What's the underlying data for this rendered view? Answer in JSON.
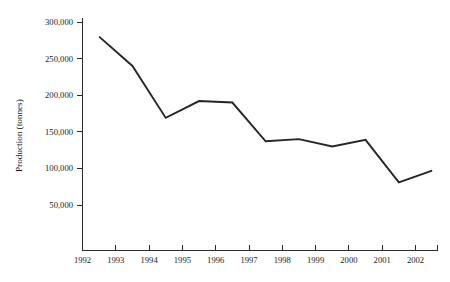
{
  "chart_data": {
    "type": "line",
    "title": "",
    "subtitle": "",
    "xlabel": "",
    "ylabel": "Production (tonnes)",
    "x": [
      1992.5,
      1993.5,
      1994.5,
      1995.5,
      1996.5,
      1997.5,
      1998.5,
      1999.5,
      2000.5,
      2001.5,
      2002.5
    ],
    "values": [
      280000,
      240000,
      169000,
      192000,
      190000,
      137000,
      140000,
      130000,
      139000,
      81000,
      97000
    ],
    "series": [
      {
        "name": "Production",
        "values": [
          280000,
          240000,
          169000,
          192000,
          190000,
          137000,
          140000,
          130000,
          139000,
          81000,
          97000
        ]
      }
    ],
    "categories": [
      "1992",
      "1993",
      "1994",
      "1995",
      "1996",
      "1997",
      "1998",
      "1999",
      "2000",
      "2001",
      "2002"
    ],
    "x_tick_labels": [
      "1992",
      "1993",
      "1994",
      "1995",
      "1996",
      "1997",
      "1998",
      "1999",
      "2000",
      "2001",
      "2002"
    ],
    "y_tick_labels": [
      "300,000",
      "250,000",
      "200,000",
      "150,000",
      "100,000",
      "50,000"
    ],
    "y_tick_values": [
      300000,
      250000,
      200000,
      150000,
      100000,
      50000
    ],
    "xlim": [
      1992,
      2003
    ],
    "ylim": [
      0,
      300000
    ],
    "grid": false,
    "legend": false,
    "legend_position": "none",
    "line_color": "#262626",
    "axis_color": "#2b2b2b",
    "background_color": "#ffffff",
    "annotations": []
  },
  "axes": {
    "y_axis_title": "Production (tonnes)",
    "x_axis_title": ""
  }
}
